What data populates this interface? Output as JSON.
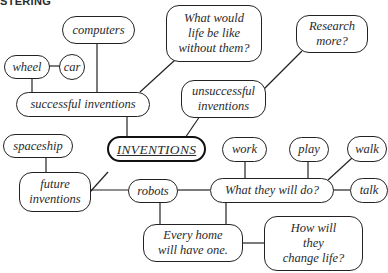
{
  "heading": "STERING",
  "central": {
    "label": "INVENTIONS"
  },
  "nodes": {
    "computers": "computers",
    "wheel": "wheel",
    "car": "car",
    "successful": "successful inventions",
    "what_would_life": "What would\nlife be like\nwithout them?",
    "research_more": "Research\nmore?",
    "unsuccessful": "unsuccessful\ninventions",
    "spaceship": "spaceship",
    "future": "future\ninventions",
    "robots": "robots",
    "work": "work",
    "play": "play",
    "walk": "walk",
    "talk": "talk",
    "what_they_do": "What they will do?",
    "every_home": "Every home\nwill have one.",
    "change_life": "How will\nthey\nchange life?"
  },
  "colors": {
    "line": "#222222",
    "text": "#2a2a2a",
    "background": "#ffffff"
  }
}
